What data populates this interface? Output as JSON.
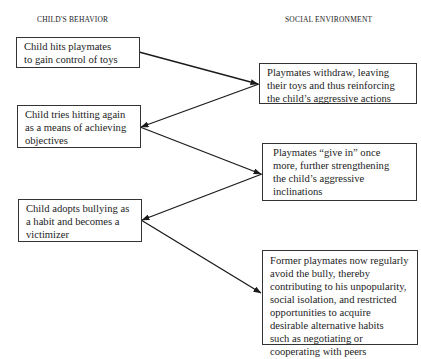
{
  "headers": {
    "left": "CHILD'S BEHAVIOR",
    "right": "SOCIAL ENVIRONMENT"
  },
  "child_behavior": [
    {
      "lines": [
        "Child hits playmates",
        "to gain control of toys"
      ]
    },
    {
      "lines": [
        "Child tries hitting again",
        "as a means of achieving",
        "objectives"
      ]
    },
    {
      "lines": [
        "Child adopts bullying as",
        "a habit and becomes a",
        "victimizer"
      ]
    }
  ],
  "social_environment": [
    {
      "lines": [
        "Playmates withdraw, leaving",
        "their toys and thus reinforcing",
        "the child’s aggressive actions"
      ]
    },
    {
      "lines": [
        "Playmates “give in” once",
        "more, further strengthening",
        "the child’s aggressive",
        "inclinations"
      ]
    },
    {
      "lines": [
        "Former playmates now regularly",
        "avoid the bully, thereby",
        "contributing to his unpopularity,",
        "social isolation, and restricted",
        "opportunities to acquire",
        "desirable alternative habits",
        "such as negotiating or",
        "cooperating with peers"
      ]
    }
  ],
  "arrows": [
    {
      "from": "child_behavior.0",
      "to": "social_environment.0"
    },
    {
      "from": "social_environment.0",
      "to": "child_behavior.1"
    },
    {
      "from": "child_behavior.1",
      "to": "social_environment.1"
    },
    {
      "from": "social_environment.1",
      "to": "child_behavior.2"
    },
    {
      "from": "child_behavior.2",
      "to": "social_environment.2"
    }
  ],
  "colors": {
    "line": "#1a1a1a",
    "background": "#ffffff"
  }
}
